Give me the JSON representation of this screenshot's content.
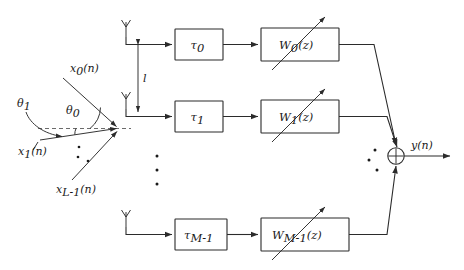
{
  "diagram": {
    "colors": {
      "line": "#2b2b2b",
      "dashed_axis": "#6b6b6b",
      "background": "#ffffff",
      "text": "#1a1a1a"
    },
    "sources": {
      "caption": "Incoming plane-wave signals arriving at the array",
      "signals": [
        {
          "id": "x0",
          "label_base": "x",
          "label_sub": "0",
          "label_tail": "(n)",
          "full": "x_0(n)"
        },
        {
          "id": "x1",
          "label_base": "x",
          "label_sub": "1",
          "label_tail": "(n)",
          "full": "x_1(n)"
        },
        {
          "id": "xLm1",
          "label_base": "x",
          "label_sub": "L-1",
          "label_tail": "(n)",
          "full": "x_{L-1}(n)"
        }
      ],
      "angles": [
        {
          "id": "theta0",
          "label_base": "θ",
          "label_sub": "0",
          "full": "θ_0"
        },
        {
          "id": "theta1",
          "label_base": "θ",
          "label_sub": "1",
          "full": "θ_1"
        }
      ],
      "ellipsis": "three-dots"
    },
    "array": {
      "spacing_label": "l",
      "antenna_count_shown": 3,
      "antenna_icon": "antenna-icon",
      "ellipsis": "three-dots"
    },
    "branches": [
      {
        "index": 0,
        "delay": {
          "base": "τ",
          "sub": "0",
          "full": "τ_0"
        },
        "filter": {
          "base": "W",
          "sub": "0",
          "tail": "(z)",
          "full": "W_0(z)"
        }
      },
      {
        "index": 1,
        "delay": {
          "base": "τ",
          "sub": "1",
          "full": "τ_1"
        },
        "filter": {
          "base": "W",
          "sub": "1",
          "tail": "(z)",
          "full": "W_1(z)"
        }
      },
      {
        "index": 2,
        "delay": {
          "base": "τ",
          "sub": "M-1",
          "full": "τ_{M-1}"
        },
        "filter": {
          "base": "W",
          "sub": "M-1",
          "tail": "(z)",
          "full": "W_{M-1}(z)"
        }
      }
    ],
    "summer": {
      "symbol": "⊕",
      "name": "summing-junction"
    },
    "output": {
      "label_base": "y",
      "label_tail": "(n)",
      "full": "y(n)"
    }
  }
}
